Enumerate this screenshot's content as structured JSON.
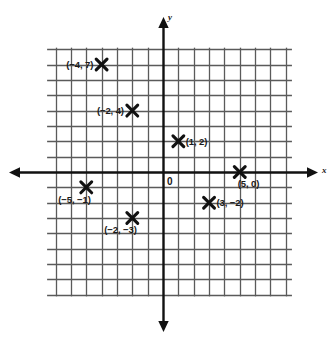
{
  "figure": {
    "type": "coordinate-plane",
    "origin_label": "0",
    "x_axis_label": "x",
    "y_axis_label": "y"
  },
  "chart_data": {
    "type": "scatter",
    "title": "",
    "xlabel": "x",
    "ylabel": "y",
    "grid": true,
    "legend": "none",
    "xlim": [
      -8,
      8
    ],
    "ylim": [
      -8,
      8
    ],
    "x_tick_step": 1,
    "y_tick_step": 1,
    "origin_label": "0",
    "points": [
      {
        "label": "(−4, 7)",
        "x": -4,
        "y": 7,
        "label_side": "left"
      },
      {
        "label": "(−2, 4)",
        "x": -2,
        "y": 4,
        "label_side": "left"
      },
      {
        "label": "(1, 2)",
        "x": 1,
        "y": 2,
        "label_side": "right"
      },
      {
        "label": "(5, 0)",
        "x": 5,
        "y": 0,
        "label_side": "below-right"
      },
      {
        "label": "(−5, −1)",
        "x": -5,
        "y": -1,
        "label_side": "below-left"
      },
      {
        "label": "(3, −2)",
        "x": 3,
        "y": -2,
        "label_side": "right"
      },
      {
        "label": "(−2, −3)",
        "x": -2,
        "y": -3,
        "label_side": "below-left"
      }
    ]
  },
  "colors": {
    "grid": "#5a5a5a",
    "axis": "#111111",
    "marker": "#111111",
    "text": "#1a1a1a",
    "background": "#ffffff"
  }
}
